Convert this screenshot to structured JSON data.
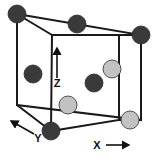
{
  "figure": {
    "name": "unit-cell-crystal-structure-diagram",
    "background_color": "#ffffff",
    "width": 159,
    "height": 160
  },
  "cube": {
    "edge_color": "#1a1a1a",
    "edge_width": 2,
    "back_face": [
      [
        17,
        14
      ],
      [
        141,
        35
      ],
      [
        141,
        120
      ],
      [
        17,
        105
      ]
    ],
    "front_face": [
      [
        52,
        35
      ],
      [
        119,
        35
      ],
      [
        119,
        120
      ],
      [
        51,
        131
      ]
    ],
    "connectors": [
      [
        [
          17,
          14
        ],
        [
          52,
          35
        ]
      ],
      [
        [
          141,
          35
        ],
        [
          119,
          35
        ]
      ],
      [
        [
          17,
          105
        ],
        [
          51,
          131
        ]
      ],
      [
        [
          141,
          120
        ],
        [
          119,
          120
        ]
      ]
    ]
  },
  "atoms": {
    "dark_color": "#3a3a3a",
    "light_color": "#c2c2c2",
    "outline_color": "#2b2b2b",
    "radius": 9,
    "items": [
      {
        "label": "corner-atom-back-top-left",
        "x": 17,
        "y": 14,
        "shade": "dark"
      },
      {
        "label": "edge-atom-back-top-center",
        "x": 77,
        "y": 24,
        "shade": "dark"
      },
      {
        "label": "corner-atom-back-top-right",
        "x": 141,
        "y": 35,
        "shade": "dark"
      },
      {
        "label": "face-atom-left",
        "x": 33,
        "y": 74,
        "shade": "dark"
      },
      {
        "label": "interior-atom-center",
        "x": 94,
        "y": 83,
        "shade": "dark"
      },
      {
        "label": "corner-atom-front-bottom-left",
        "x": 51,
        "y": 131,
        "shade": "dark"
      },
      {
        "label": "face-atom-right-upper",
        "x": 112,
        "y": 69,
        "shade": "light"
      },
      {
        "label": "edge-atom-front-bottom",
        "x": 68,
        "y": 105,
        "shade": "light"
      },
      {
        "label": "corner-atom-front-bottom-right",
        "x": 130,
        "y": 120,
        "shade": "light"
      }
    ]
  },
  "axes": {
    "z": {
      "label": "Z",
      "label_x": 57,
      "label_y": 87,
      "line": [
        [
          57,
          78
        ],
        [
          57,
          51
        ]
      ],
      "arrow_tip": [
        57,
        48
      ]
    },
    "y": {
      "label": "Y",
      "label_x": 38,
      "label_y": 142,
      "line": [
        [
          34,
          134
        ],
        [
          16,
          124
        ]
      ],
      "arrow_tip": [
        11,
        121
      ]
    },
    "x": {
      "label": "X",
      "label_x": 97,
      "label_y": 149,
      "line": [
        [
          106,
          145
        ],
        [
          124,
          145
        ]
      ],
      "arrow_tip": [
        129,
        145
      ]
    },
    "color": "#111111"
  }
}
